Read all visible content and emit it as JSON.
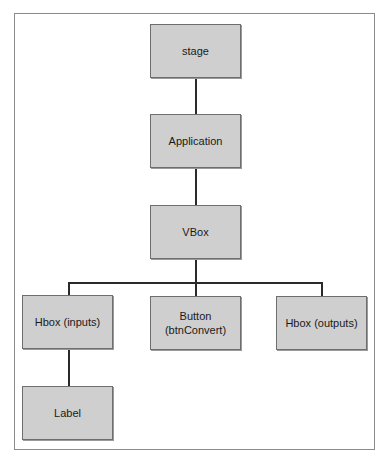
{
  "diagram": {
    "type": "tree",
    "nodes": [
      {
        "id": "stage",
        "label": "stage"
      },
      {
        "id": "application",
        "label": "Application"
      },
      {
        "id": "vbox",
        "label": "VBox"
      },
      {
        "id": "hbox-inputs",
        "label": "Hbox (inputs)"
      },
      {
        "id": "button",
        "label": "Button\n(btnConvert)"
      },
      {
        "id": "hbox-outputs",
        "label": "Hbox (outputs)"
      },
      {
        "id": "label",
        "label": "Label"
      }
    ],
    "edges": [
      [
        "stage",
        "application"
      ],
      [
        "application",
        "vbox"
      ],
      [
        "vbox",
        "hbox-inputs"
      ],
      [
        "vbox",
        "button"
      ],
      [
        "vbox",
        "hbox-outputs"
      ],
      [
        "hbox-inputs",
        "label"
      ]
    ],
    "colors": {
      "node_fill": "#cfcfcf",
      "node_border": "#6e6e6e",
      "edge": "#2a2a2a",
      "frame": "#8a8a8a"
    }
  }
}
